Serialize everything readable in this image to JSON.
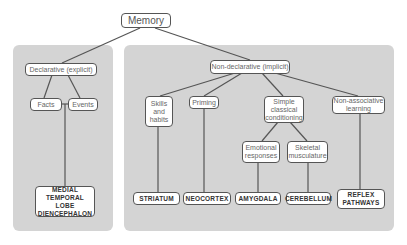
{
  "root": {
    "label": "Memory"
  },
  "declarative": {
    "label": "Declarative (explicit)",
    "children": [
      {
        "label": "Facts"
      },
      {
        "label": "Events"
      }
    ],
    "structure": "MEDIAL\nTEMPORAL LOBE\nDIENCEPHALON"
  },
  "nondeclarative": {
    "label": "Non-declarative (implicit)",
    "children": [
      {
        "label": "Skills\nand\nhabits",
        "structure": "STRIATUM"
      },
      {
        "label": "Priming",
        "structure": "NEOCORTEX"
      },
      {
        "label": "Simple\nclassical\nconditioning",
        "children": [
          {
            "label": "Emotional\nresponses",
            "structure": "AMYGDALA"
          },
          {
            "label": "Skeletal\nmusculature",
            "structure": "CEREBELLUM"
          }
        ]
      },
      {
        "label": "Non-associative\nlearning",
        "structure": "REFLEX\nPATHWAYS"
      }
    ]
  },
  "colors": {
    "panel": "#d4d4d4",
    "box_border": "#555555",
    "line": "#555555"
  }
}
